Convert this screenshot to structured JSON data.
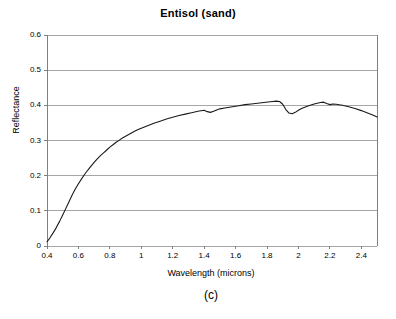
{
  "figure": {
    "caption": "(c)",
    "title": "Entisol (sand)"
  },
  "axes": {
    "x_title": "Wavelength (microns)",
    "y_title": "Reflectance",
    "x_ticks": [
      "0.4",
      "0.6",
      "0.8",
      "1",
      "1.2",
      "1.4",
      "1.6",
      "1.8",
      "2",
      "2.2",
      "2.4"
    ],
    "y_ticks": [
      "0.6",
      "0.5",
      "0.4",
      "0.3",
      "0.2",
      "0.1",
      "0"
    ]
  },
  "style": {
    "line_color": "#1a1a1a",
    "grid_color": "#a6a6a6",
    "axis_color": "#808080",
    "background": "#ffffff"
  },
  "chart_data": {
    "type": "line",
    "title": "Entisol (sand)",
    "subtitle": "(c)",
    "xlabel": "Wavelength (microns)",
    "ylabel": "Reflectance",
    "xlim": [
      0.4,
      2.5
    ],
    "ylim": [
      0,
      0.6
    ],
    "xticks": [
      0.4,
      0.6,
      0.8,
      1.0,
      1.2,
      1.4,
      1.6,
      1.8,
      2.0,
      2.2,
      2.4
    ],
    "yticks": [
      0,
      0.1,
      0.2,
      0.3,
      0.4,
      0.5,
      0.6
    ],
    "grid": "horizontal",
    "legend": "none",
    "series": [
      {
        "name": "Entisol (sand) reflectance",
        "x": [
          0.4,
          0.42,
          0.44,
          0.46,
          0.48,
          0.5,
          0.52,
          0.54,
          0.56,
          0.58,
          0.6,
          0.62,
          0.64,
          0.66,
          0.68,
          0.7,
          0.72,
          0.74,
          0.76,
          0.78,
          0.8,
          0.82,
          0.84,
          0.86,
          0.88,
          0.9,
          0.92,
          0.94,
          0.96,
          0.98,
          1.0,
          1.04,
          1.08,
          1.12,
          1.16,
          1.2,
          1.24,
          1.28,
          1.32,
          1.36,
          1.4,
          1.42,
          1.44,
          1.46,
          1.48,
          1.5,
          1.54,
          1.58,
          1.62,
          1.66,
          1.7,
          1.74,
          1.78,
          1.82,
          1.86,
          1.88,
          1.9,
          1.92,
          1.94,
          1.96,
          1.98,
          2.0,
          2.02,
          2.06,
          2.1,
          2.14,
          2.16,
          2.18,
          2.2,
          2.22,
          2.24,
          2.28,
          2.32,
          2.36,
          2.4,
          2.44,
          2.48,
          2.5
        ],
        "y": [
          0.012,
          0.024,
          0.038,
          0.053,
          0.07,
          0.088,
          0.107,
          0.126,
          0.145,
          0.162,
          0.177,
          0.191,
          0.204,
          0.216,
          0.227,
          0.238,
          0.248,
          0.257,
          0.265,
          0.273,
          0.281,
          0.288,
          0.295,
          0.301,
          0.307,
          0.312,
          0.317,
          0.322,
          0.327,
          0.331,
          0.335,
          0.342,
          0.349,
          0.355,
          0.361,
          0.366,
          0.371,
          0.375,
          0.379,
          0.383,
          0.386,
          0.382,
          0.38,
          0.383,
          0.387,
          0.39,
          0.393,
          0.396,
          0.399,
          0.402,
          0.404,
          0.406,
          0.408,
          0.41,
          0.412,
          0.411,
          0.403,
          0.388,
          0.378,
          0.376,
          0.38,
          0.386,
          0.391,
          0.398,
          0.404,
          0.408,
          0.409,
          0.405,
          0.402,
          0.404,
          0.403,
          0.4,
          0.396,
          0.391,
          0.385,
          0.378,
          0.371,
          0.367
        ]
      }
    ]
  }
}
